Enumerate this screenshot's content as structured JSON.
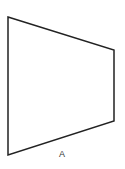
{
  "diagram": {
    "shape": {
      "type": "quadrilateral",
      "points": [
        [
          8,
          17
        ],
        [
          114,
          50
        ],
        [
          114,
          121
        ],
        [
          8,
          155
        ]
      ],
      "stroke": "#222222",
      "stroke_width": 1.5,
      "fill": "#ffffff"
    },
    "label": {
      "text": "A",
      "x": 62,
      "y": 157
    }
  }
}
